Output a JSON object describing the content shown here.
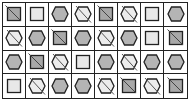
{
  "grid": {
    "columns": 8,
    "rows": 4,
    "cells": [
      [
        "square-slash",
        "square",
        "hexagon",
        "hexagon-slash",
        "square-slash",
        "hexagon-slash",
        "square",
        "hexagon"
      ],
      [
        "hexagon-slash",
        "hexagon",
        "square-slash",
        "hexagon",
        "hexagon-slash",
        "hexagon",
        "square",
        "square-slash"
      ],
      [
        "hexagon",
        "square-slash",
        "hexagon-slash",
        "square",
        "hexagon",
        "hexagon-slash",
        "hexagon",
        "hexagon"
      ],
      [
        "square",
        "hexagon-slash",
        "hexagon",
        "hexagon",
        "hexagon-slash",
        "square-slash",
        "hexagon-slash",
        "square-slash"
      ]
    ]
  },
  "colors": {
    "line": "#222222",
    "square_fill": "#e8e8e8",
    "square_slash_fill": "#a8a8a8",
    "hexagon_fill": "#b4b4b4",
    "hexagon_slash_fill": "#ececec"
  }
}
